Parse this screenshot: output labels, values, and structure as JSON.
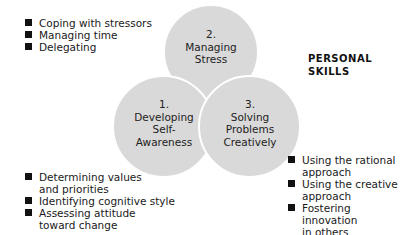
{
  "title": [
    "PERSONAL",
    "SKILLS"
  ],
  "circles": [
    {
      "number": "2.",
      "lines": [
        "Managing",
        "Stress"
      ]
    },
    {
      "number": "1.",
      "lines": [
        "Developing",
        "Self-",
        "Awareness"
      ]
    },
    {
      "number": "3.",
      "lines": [
        "Solving",
        "Problems",
        "Creatively"
      ]
    }
  ],
  "lists": {
    "stress": [
      "Coping with stressors",
      "Managing time",
      "Delegating"
    ],
    "awareness": [
      [
        "Determining values",
        "and priorities"
      ],
      [
        "Identifying cognitive style"
      ],
      [
        "Assessing attitude",
        "toward change"
      ]
    ],
    "problems": [
      [
        "Using the rational",
        "approach"
      ],
      [
        "Using the creative",
        "approach"
      ],
      [
        "Fostering innovation",
        "in others"
      ]
    ]
  },
  "colors": {
    "circle_fill": "#d9d9d9",
    "bullet": "#111111"
  }
}
